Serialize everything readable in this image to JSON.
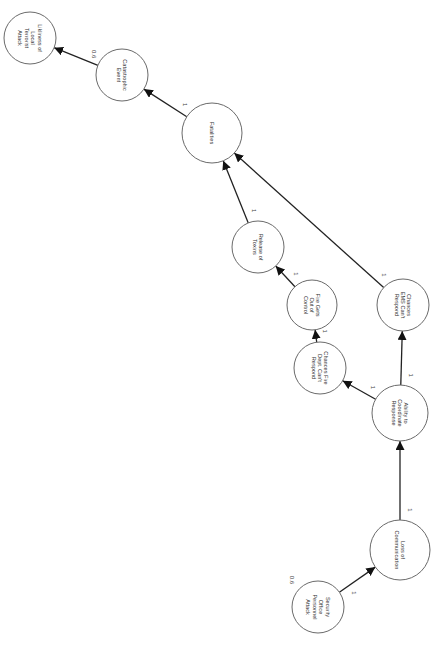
{
  "diagram": {
    "orientation": "rotated-90-clockwise",
    "colors": {
      "node_stroke": "#6a6a6a",
      "node_fill": "#ffffff",
      "edge": "#222222",
      "text": "#333333"
    },
    "nodes": [
      {
        "id": "likliness",
        "lines": [
          "Likliness of",
          "Local",
          "Terrorist",
          "Attack"
        ],
        "cx": 30,
        "cy": 38,
        "r": 26
      },
      {
        "id": "catastrophic",
        "lines": [
          "Catastrophic",
          "Event"
        ],
        "cx": 122,
        "cy": 75,
        "r": 26,
        "label": "0.6"
      },
      {
        "id": "fatalities",
        "lines": [
          "Fatalities"
        ],
        "cx": 212,
        "cy": 133,
        "r": 30,
        "label": "1"
      },
      {
        "id": "toxins",
        "lines": [
          "Release of",
          "Toxins"
        ],
        "cx": 258,
        "cy": 247,
        "r": 26,
        "label": "1"
      },
      {
        "id": "fire_control",
        "lines": [
          "Fire Gets",
          "Out of",
          "Control"
        ],
        "cx": 312,
        "cy": 305,
        "r": 25,
        "label": "1"
      },
      {
        "id": "fire_dept",
        "lines": [
          "Chances Fire",
          "Dept. Can't",
          "Respond"
        ],
        "cx": 320,
        "cy": 368,
        "r": 26,
        "label": "1"
      },
      {
        "id": "ems",
        "lines": [
          "Chances",
          "EMS Can't",
          "Respond"
        ],
        "cx": 403,
        "cy": 305,
        "r": 26,
        "label": "1"
      },
      {
        "id": "coordinate",
        "lines": [
          "Ability to",
          "Coordinate",
          "Response"
        ],
        "cx": 400,
        "cy": 413,
        "r": 28,
        "label": "1"
      },
      {
        "id": "communication",
        "lines": [
          "Loss of",
          "Communication"
        ],
        "cx": 400,
        "cy": 550,
        "r": 30,
        "label": "1"
      },
      {
        "id": "security",
        "lines": [
          "Security",
          "Office",
          "Personnel",
          "Attack"
        ],
        "cx": 318,
        "cy": 607,
        "r": 26,
        "label": "0.6"
      }
    ],
    "edges": [
      {
        "from": "catastrophic",
        "to": "likliness",
        "label": "0.6"
      },
      {
        "from": "fatalities",
        "to": "catastrophic",
        "label": "1"
      },
      {
        "from": "toxins",
        "to": "fatalities",
        "label": "1"
      },
      {
        "from": "ems",
        "to": "fatalities",
        "label": "1"
      },
      {
        "from": "fire_control",
        "to": "toxins",
        "label": "1"
      },
      {
        "from": "fire_dept",
        "to": "fire_control",
        "label": "1"
      },
      {
        "from": "coordinate",
        "to": "fire_dept",
        "label": "1"
      },
      {
        "from": "coordinate",
        "to": "ems",
        "label": "1"
      },
      {
        "from": "communication",
        "to": "coordinate",
        "label": "1"
      },
      {
        "from": "security",
        "to": "communication",
        "label": "1"
      }
    ],
    "standalone_labels": [
      {
        "text": "0.6",
        "x": 290,
        "y": 580
      }
    ]
  }
}
